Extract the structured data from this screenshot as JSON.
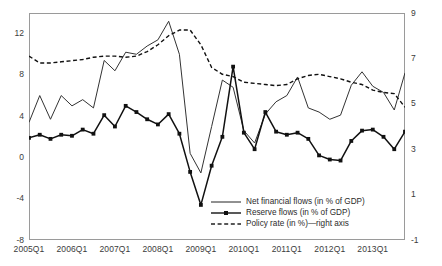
{
  "chart_data": {
    "type": "line",
    "title": "",
    "subtitle": "",
    "xlabel": "",
    "ylabel": "",
    "y2label": "",
    "grid": false,
    "legend_position": "inside-bottom-right",
    "ylim": [
      -8,
      14
    ],
    "y2lim": [
      -1,
      9
    ],
    "yticks": [
      "12",
      "8",
      "4",
      "0",
      "-4",
      "-8"
    ],
    "ytick_values": [
      12,
      8,
      4,
      0,
      -4,
      -8
    ],
    "y2ticks": [
      "9",
      "7",
      "5",
      "3",
      "1",
      "-1"
    ],
    "y2tick_values": [
      9,
      7,
      5,
      3,
      1,
      -1
    ],
    "xticks": [
      "2005Q1",
      "2006Q1",
      "2007Q1",
      "2008Q1",
      "2009Q1",
      "2010Q1",
      "2011Q1",
      "2012Q1",
      "2013Q1"
    ],
    "x": [
      "2005Q1",
      "2005Q2",
      "2005Q3",
      "2005Q4",
      "2006Q1",
      "2006Q2",
      "2006Q3",
      "2006Q4",
      "2007Q1",
      "2007Q2",
      "2007Q3",
      "2007Q4",
      "2008Q1",
      "2008Q2",
      "2008Q3",
      "2008Q4",
      "2009Q1",
      "2009Q2",
      "2009Q3",
      "2009Q4",
      "2010Q1",
      "2010Q2",
      "2010Q3",
      "2010Q4",
      "2011Q1",
      "2011Q2",
      "2011Q3",
      "2011Q4",
      "2012Q1",
      "2012Q2",
      "2012Q3",
      "2012Q4",
      "2013Q1",
      "2013Q2",
      "2013Q3",
      "2013Q4"
    ],
    "series": [
      {
        "name": "Net financial flows (in % of GDP)",
        "axis": "left",
        "style": "solid",
        "marker": "none",
        "color": "#333333",
        "values": [
          3.4,
          6.0,
          3.7,
          6.0,
          5.0,
          5.6,
          4.8,
          9.4,
          8.4,
          10.2,
          10.0,
          10.8,
          11.4,
          13.2,
          10.0,
          0.4,
          -1.5,
          3.0,
          7.5,
          6.8,
          2.6,
          1.4,
          4.2,
          5.4,
          6.0,
          7.8,
          4.8,
          4.4,
          3.7,
          4.1,
          7.0,
          8.3,
          6.9,
          6.3,
          4.6,
          8.2
        ]
      },
      {
        "name": "Reserve flows (in % of GDP)",
        "axis": "left",
        "style": "solid",
        "marker": "square",
        "color": "#111111",
        "values": [
          1.9,
          2.2,
          1.8,
          2.2,
          2.1,
          2.7,
          2.3,
          4.1,
          3.0,
          5.0,
          4.4,
          3.7,
          3.2,
          4.2,
          2.3,
          -1.4,
          -4.6,
          -0.8,
          2.0,
          8.8,
          2.4,
          0.8,
          4.4,
          2.5,
          2.2,
          2.4,
          1.8,
          0.2,
          -0.2,
          -0.3,
          1.6,
          2.6,
          2.7,
          2.0,
          0.8,
          2.5
        ]
      },
      {
        "name": "Policy rate (in %)—right axis",
        "axis": "right",
        "style": "dashed",
        "marker": "none",
        "color": "#111111",
        "values": [
          7.1,
          6.8,
          6.8,
          6.85,
          6.9,
          6.95,
          7.05,
          7.1,
          7.1,
          7.05,
          7.1,
          7.3,
          7.6,
          8.0,
          8.25,
          8.25,
          7.6,
          6.6,
          6.3,
          6.2,
          5.95,
          5.9,
          5.85,
          5.8,
          5.85,
          6.1,
          6.25,
          6.3,
          6.2,
          6.1,
          5.95,
          5.85,
          5.6,
          5.5,
          5.45,
          4.85
        ]
      }
    ],
    "legend": [
      {
        "label": "Net financial flows (in % of GDP)",
        "style": "solid",
        "marker": "none"
      },
      {
        "label": "Reserve flows (in % of GDP)",
        "style": "solid",
        "marker": "square"
      },
      {
        "label": "Policy rate (in %)—right axis",
        "style": "dashed",
        "marker": "none"
      }
    ],
    "colors": {
      "axis": "#9a9a9a",
      "text": "#3b3b3b",
      "series_net": "#333333",
      "series_reserve": "#111111",
      "series_policy": "#111111",
      "background": "#ffffff"
    }
  }
}
